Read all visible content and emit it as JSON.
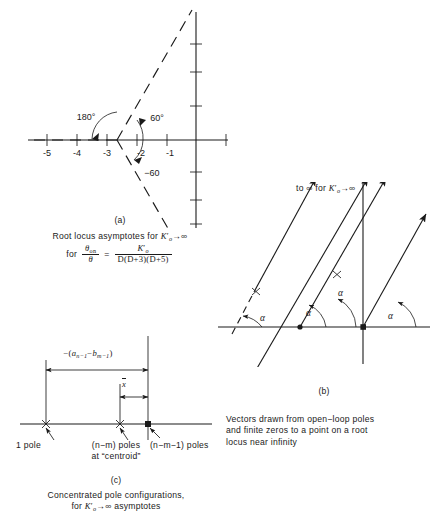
{
  "figure": {
    "ink_color": "#1a1a1a",
    "background": "#ffffff"
  },
  "panel_a": {
    "letter": "(a)",
    "caption_line1": "Root locus asymptotes for",
    "caption_line1_symbol": "K",
    "caption_line1_sub": "o",
    "caption_line1_tail": "→∞",
    "caption_line2_prefix": "for",
    "ratio_num": "θ",
    "ratio_num_sub": "on",
    "ratio_den": "θ",
    "equals": "=",
    "frac_num": "K",
    "frac_num_sub": "o",
    "frac_den": "D(D+3)(D+5)",
    "axis_labels": [
      "-5",
      "-4",
      "-3",
      "-2",
      "-1"
    ],
    "axis_label_values": [
      -5,
      -4,
      -3,
      -2,
      -1
    ],
    "angle_labels": [
      "180°",
      "60°",
      "−60"
    ],
    "asymptote_angles_deg": [
      60,
      180,
      -60
    ],
    "centroid_real": -2.667,
    "vertical_axis_ticks": 6,
    "horizontal_axis_ticks": 6
  },
  "panel_b": {
    "letter": "(b)",
    "top_label_prefix": "to ∞ for",
    "top_label_symbol": "K",
    "top_label_sub": "o",
    "top_label_tail": "→∞",
    "angle_label": "α",
    "angle_label_count": 4,
    "caption_line1": "Vectors drawn from open−loop poles",
    "caption_line2": "and finite zeros to a point on a root",
    "caption_line3": "locus near infinity",
    "vector_count": 4,
    "dashed_vector_index": 1,
    "pole_marker": "x",
    "zero_marker": "dot",
    "vector_angle_deg": 63
  },
  "panel_c": {
    "letter": "(c)",
    "dimension_label": {
      "minus": "−(",
      "a_symbol": "a",
      "a_sub": "n−1",
      "operator": "−",
      "b_symbol": "b",
      "b_sub": "m−1",
      "close": ")"
    },
    "xbar_label": "x",
    "xbar_has_overline": true,
    "marker_labels": [
      "1 pole",
      "(n−m) poles",
      "at “centroid”",
      "(n−m−1) poles"
    ],
    "label_left": "1 pole",
    "label_mid_line1": "(n−m) poles",
    "label_mid_line2": "at “centroid”",
    "label_right": "(n−m−1) poles",
    "caption_line1": "Concentrated pole configurations,",
    "caption_line2_prefix": "for",
    "caption_line2_symbol": "K",
    "caption_line2_sub": "o",
    "caption_line2_tail": "→∞ asymptotes"
  }
}
